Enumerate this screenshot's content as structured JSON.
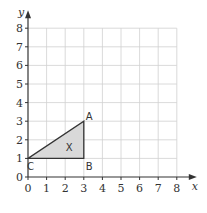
{
  "axes": {
    "x_label": "x",
    "y_label": "y",
    "x_ticks": [
      "0",
      "1",
      "2",
      "3",
      "4",
      "5",
      "6",
      "7",
      "8"
    ],
    "y_ticks": [
      "0",
      "1",
      "2",
      "3",
      "4",
      "5",
      "6",
      "7",
      "8"
    ],
    "x_range": [
      0,
      8
    ],
    "y_range": [
      0,
      8
    ],
    "grid": true
  },
  "shape": {
    "name": "X",
    "fill": "#d9d9d9",
    "stroke": "#333333",
    "vertices": [
      {
        "label": "A",
        "x": 3,
        "y": 3
      },
      {
        "label": "B",
        "x": 3,
        "y": 1
      },
      {
        "label": "C",
        "x": 0,
        "y": 1
      }
    ]
  },
  "colors": {
    "grid": "#d0d0d0",
    "axis": "#333333"
  }
}
